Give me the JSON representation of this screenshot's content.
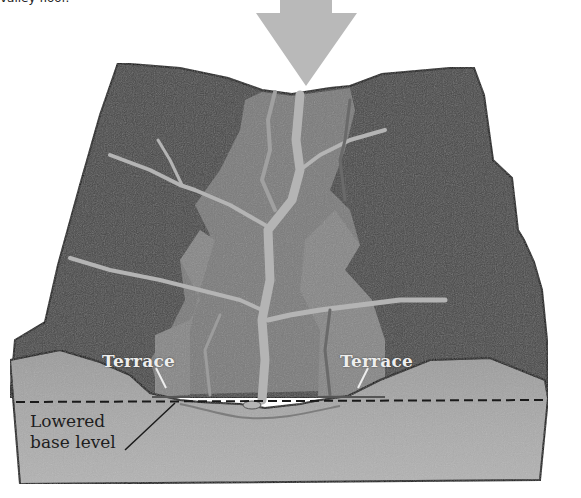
{
  "figure": {
    "top_fragment": "valley floor.",
    "labels": {
      "terrace_left": "Terrace",
      "terrace_right": "Terrace",
      "base_level_line1": "Lowered",
      "base_level_line2": "base level"
    }
  },
  "colors": {
    "background": "#ffffff",
    "upland_dark": "#474747",
    "valley_mid": "#7a7a7a",
    "terrace_fill": "#858585",
    "stream": "#b4b4b4",
    "arrow": "#b9b9b9",
    "cross_section": "#a8a8a8",
    "outline": "#111111"
  }
}
